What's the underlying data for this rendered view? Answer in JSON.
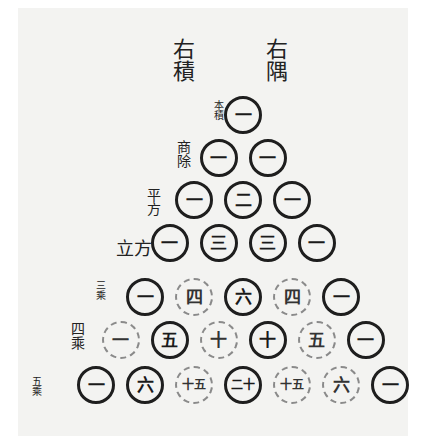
{
  "headers": {
    "left": "右積",
    "right": "右隅"
  },
  "row_labels": [
    {
      "text": "本積",
      "row": 1
    },
    {
      "text": "商除",
      "row": 2
    },
    {
      "text": "平方",
      "row": 3
    },
    {
      "text": "立方",
      "row": 4
    },
    {
      "text": "三乘",
      "row": 5
    },
    {
      "text": "四乘",
      "row": 6
    },
    {
      "text": "五乘",
      "row": 7
    }
  ],
  "rows": [
    [
      "一"
    ],
    [
      "一",
      "一"
    ],
    [
      "一",
      "二",
      "一"
    ],
    [
      "一",
      "三",
      "三",
      "一"
    ],
    [
      "一",
      "四",
      "六",
      "四",
      "一"
    ],
    [
      "一",
      "五",
      "十",
      "十",
      "五",
      "一"
    ],
    [
      "一",
      "六",
      "十五",
      "二十",
      "十五",
      "六",
      "一"
    ]
  ],
  "ink_color": "#1e1e1e",
  "paper_color": "#f3f3f1"
}
